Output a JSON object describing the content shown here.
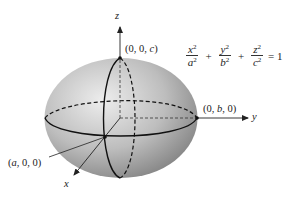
{
  "figure": {
    "equation": {
      "terms": [
        {
          "num": "x",
          "den": "a",
          "exp": "2"
        },
        {
          "num": "y",
          "den": "b",
          "exp": "2"
        },
        {
          "num": "z",
          "den": "c",
          "exp": "2"
        }
      ],
      "plus": "+",
      "rhs": "= 1"
    },
    "axes": {
      "x": "x",
      "y": "y",
      "z": "z"
    },
    "points": {
      "top": {
        "pre": "(0, 0, ",
        "var": "c",
        "post": ")"
      },
      "right": {
        "pre": "(0, ",
        "var": "b",
        "post": ", 0)"
      },
      "front": {
        "pre": "(",
        "var": "a",
        "post": ", 0, 0)"
      }
    },
    "colors": {
      "surface_light": "#e8e8e8",
      "surface_dark": "#7a7a7a",
      "line": "#111111"
    }
  }
}
